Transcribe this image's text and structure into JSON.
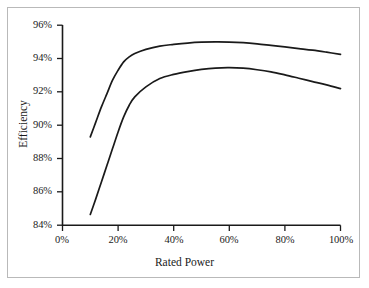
{
  "chart_data": {
    "type": "line",
    "title": "",
    "xlabel": "Rated Power",
    "ylabel": "Efficiency",
    "xlim": [
      0,
      100
    ],
    "ylim": [
      84,
      96
    ],
    "xticks": [
      "0%",
      "20%",
      "40%",
      "60%",
      "80%",
      "100%"
    ],
    "xtick_values": [
      0,
      20,
      40,
      60,
      80,
      100
    ],
    "yticks": [
      "84%",
      "86%",
      "88%",
      "90%",
      "92%",
      "94%",
      "96%"
    ],
    "ytick_values": [
      84,
      86,
      88,
      90,
      92,
      94,
      96
    ],
    "grid": false,
    "legend": null,
    "series": [
      {
        "name": "upper-efficiency-curve",
        "color": "#1a1a1a",
        "x": [
          10,
          12,
          14,
          16,
          18,
          20,
          22,
          24,
          26,
          30,
          35,
          40,
          45,
          50,
          55,
          60,
          65,
          70,
          75,
          80,
          85,
          90,
          95,
          100
        ],
        "values": [
          89.3,
          90.2,
          91.1,
          91.9,
          92.7,
          93.3,
          93.8,
          94.1,
          94.3,
          94.55,
          94.75,
          94.85,
          94.93,
          94.98,
          95.0,
          94.99,
          94.95,
          94.88,
          94.79,
          94.7,
          94.6,
          94.5,
          94.38,
          94.25
        ]
      },
      {
        "name": "lower-efficiency-curve",
        "color": "#1a1a1a",
        "x": [
          10,
          12,
          14,
          16,
          18,
          20,
          22,
          24,
          26,
          30,
          35,
          40,
          45,
          50,
          55,
          60,
          65,
          70,
          75,
          80,
          85,
          90,
          95,
          100
        ],
        "values": [
          84.65,
          85.6,
          86.6,
          87.6,
          88.6,
          89.6,
          90.5,
          91.2,
          91.7,
          92.3,
          92.8,
          93.05,
          93.22,
          93.35,
          93.43,
          93.45,
          93.42,
          93.33,
          93.2,
          93.02,
          92.82,
          92.62,
          92.42,
          92.2
        ]
      }
    ]
  },
  "axes": {
    "x_title": "Rated Power",
    "y_title": "Efficiency"
  }
}
